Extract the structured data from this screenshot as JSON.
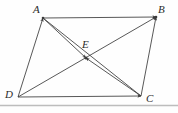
{
  "figure": {
    "name": "parallelogram-with-diagonals",
    "background_color": "#fefefe",
    "stroke_color": "#3a3a3a",
    "label_color": "#2b2b2b",
    "baseline_rule_color": "#b8b8b8",
    "labels": {
      "a": "A",
      "b": "B",
      "c": "C",
      "d": "D",
      "e": "E"
    },
    "points": {
      "A": {
        "x": 43,
        "y": 18
      },
      "B": {
        "x": 156,
        "y": 17
      },
      "C": {
        "x": 141,
        "y": 96
      },
      "D": {
        "x": 18,
        "y": 97
      },
      "E": {
        "x": 86,
        "y": 58
      }
    },
    "segments": [
      {
        "name": "side-AB",
        "from": "A",
        "to": "B",
        "arrow_at": "B"
      },
      {
        "name": "side-DC",
        "from": "D",
        "to": "C",
        "arrow_at": "C"
      },
      {
        "name": "side-DA",
        "from": "D",
        "to": "A",
        "arrow_at": "A"
      },
      {
        "name": "side-CB",
        "from": "C",
        "to": "B",
        "arrow_at": "B"
      },
      {
        "name": "diagonal-AE",
        "from": "A",
        "to": "E",
        "arrow_at": "E"
      },
      {
        "name": "diagonal-CE",
        "from": "C",
        "to": "E",
        "arrow_at": "E"
      },
      {
        "name": "diagonal-AC",
        "from": "A",
        "to": "C",
        "arrow_at": "none"
      },
      {
        "name": "diagonal-DB",
        "from": "D",
        "to": "B",
        "arrow_at": "B"
      }
    ]
  }
}
